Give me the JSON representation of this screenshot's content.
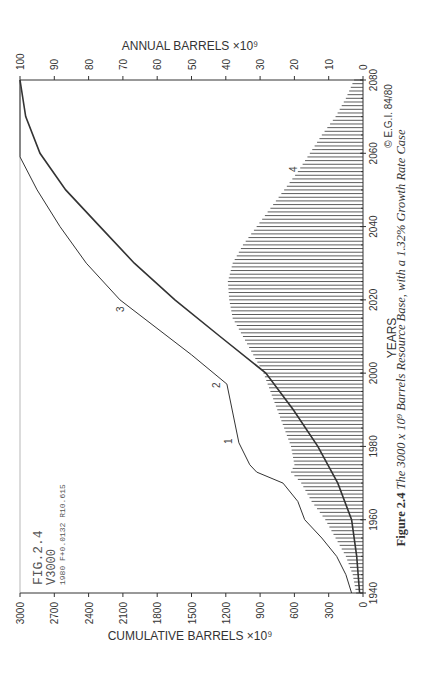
{
  "figure": {
    "caption_prefix": "Figure 2.4",
    "caption_text": "The 3000 x 10⁹ Barrels Resource Base, with a 1.32% Growth Rate Case",
    "copyright": "© E.G.I. 84/80",
    "annotation": [
      "FIG.2.4",
      "V3000",
      "1980 F+0.0132 R10.615"
    ]
  },
  "chart_data": {
    "type": "line",
    "orientation": "rotated 90° counter-clockwise (years axis vertical on right)",
    "xlabel": "YEARS",
    "ylabel_left": "CUMULATIVE BARRELS ×10⁹",
    "ylabel_right": "ANNUAL BARRELS ×10⁹",
    "xlim": [
      1940,
      2080
    ],
    "ylim_cumulative": [
      0,
      3000
    ],
    "ylim_annual": [
      0,
      100
    ],
    "x_ticks": [
      "1940",
      "1960",
      "1980",
      "2000",
      "2020",
      "2040",
      "2060",
      "2080"
    ],
    "cumulative_ticks": [
      "0",
      "300",
      "600",
      "900",
      "1200",
      "1500",
      "1800",
      "2100",
      "2400",
      "2700",
      "3000"
    ],
    "annual_ticks": [
      "0",
      "10",
      "20",
      "30",
      "40",
      "50",
      "60",
      "70",
      "80",
      "90",
      "100"
    ],
    "grid": false,
    "curve_labels": [
      "1",
      "2",
      "3",
      "4"
    ],
    "series": [
      {
        "name": "Cumulative discoveries (curve 1-2-3)",
        "axis": "cumulative",
        "x": [
          1940,
          1945,
          1950,
          1955,
          1960,
          1965,
          1970,
          1973,
          1975,
          1981,
          1997,
          2005,
          2020,
          2030,
          2040,
          2050,
          2059,
          2080
        ],
        "values": [
          100,
          150,
          230,
          360,
          510,
          570,
          700,
          930,
          990,
          1085,
          1190,
          1500,
          2125,
          2420,
          2650,
          2850,
          3000,
          3000
        ]
      },
      {
        "name": "Cumulative production",
        "axis": "cumulative",
        "x": [
          1940,
          1950,
          1960,
          1970,
          1980,
          1990,
          2000,
          2010,
          2020,
          2030,
          2040,
          2050,
          2060,
          2070,
          2080
        ],
        "values": [
          30,
          55,
          100,
          220,
          395,
          610,
          850,
          1250,
          1645,
          2000,
          2300,
          2600,
          2825,
          2950,
          3000
        ]
      },
      {
        "name": "Annual production (curve 4, hatched)",
        "axis": "annual",
        "x": [
          1940,
          1945,
          1950,
          1955,
          1960,
          1965,
          1970,
          1973,
          1975,
          1980,
          1985,
          1990,
          1995,
          2000,
          2005,
          2010,
          2015,
          2020,
          2025,
          2030,
          2035,
          2040,
          2045,
          2050,
          2055,
          2060,
          2065,
          2070,
          2075,
          2080
        ],
        "values": [
          2,
          3,
          5,
          8,
          11,
          15,
          18,
          21,
          20,
          21,
          23,
          25,
          27,
          29,
          32,
          35,
          38,
          39,
          39.4,
          38,
          35,
          31,
          27,
          23,
          19,
          15.5,
          12,
          8,
          5,
          2.6
        ]
      }
    ]
  }
}
